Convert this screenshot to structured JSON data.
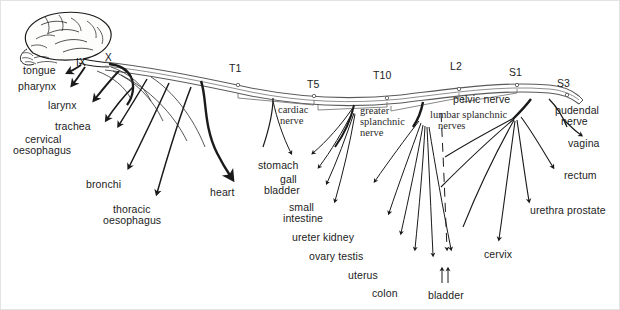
{
  "figure": {
    "background": "#ffffff",
    "ink": "#1a1a1a"
  },
  "cranial_nerves": [
    {
      "name": "glossopharyngeal",
      "label": "IX",
      "x": 78,
      "y": 62
    },
    {
      "name": "vagus",
      "label": "X",
      "x": 106,
      "y": 57
    }
  ],
  "spinal_segments": [
    {
      "label": "T1",
      "x": 237,
      "y": 68,
      "tick_x": 237,
      "tick_y": 84
    },
    {
      "label": "T5",
      "x": 313,
      "y": 84,
      "tick_x": 313,
      "tick_y": 96
    },
    {
      "label": "T10",
      "x": 382,
      "y": 75,
      "tick_x": 386,
      "tick_y": 92
    },
    {
      "label": "L2",
      "x": 455,
      "y": 66,
      "tick_x": 458,
      "tick_y": 83
    },
    {
      "label": "S1",
      "x": 512,
      "y": 72,
      "tick_x": 516,
      "tick_y": 85
    },
    {
      "label": "S3",
      "x": 561,
      "y": 82,
      "tick_x": 566,
      "tick_y": 95
    }
  ],
  "nerve_trunks": [
    {
      "name": "cardiac-nerve",
      "label": "cardiac\nnerve",
      "line1": "cardiac",
      "line2": "nerve",
      "x": 275,
      "y": 106,
      "style": "serif"
    },
    {
      "name": "greater-splanchnic-nerve",
      "label": "greater splanchnic nerve",
      "line1": "greater",
      "line2": "splanchnic",
      "line3": "nerve",
      "x": 360,
      "y": 108,
      "style": "serif"
    },
    {
      "name": "lumbar-splanchnic-nerves",
      "label": "lumbar splanchnic nerves",
      "line1": "lumbar splanchnic",
      "line2": "nerves",
      "x": 430,
      "y": 112,
      "style": "serif"
    },
    {
      "name": "pelvic-nerve",
      "label": "pelvic nerve",
      "x": 468,
      "y": 97,
      "style": "sans"
    },
    {
      "name": "pudendal-nerve",
      "label": "pudendal nerve",
      "line1": "pudendal",
      "line2": "nerve",
      "x": 556,
      "y": 108,
      "style": "sans"
    }
  ],
  "organ_labels": [
    {
      "name": "tongue",
      "text": "tongue",
      "x": 24,
      "y": 68,
      "align": "left"
    },
    {
      "name": "pharynx",
      "text": "pharynx",
      "x": 20,
      "y": 84,
      "align": "left"
    },
    {
      "name": "larynx",
      "text": "larynx",
      "x": 50,
      "y": 102,
      "align": "left"
    },
    {
      "name": "trachea",
      "text": "trachea",
      "x": 57,
      "y": 124,
      "align": "left"
    },
    {
      "name": "cervical-oesophagus",
      "text": "cervical oesophagus",
      "line1": "cervical",
      "line2": "oesophagus",
      "x": 22,
      "y": 136,
      "align": "left"
    },
    {
      "name": "bronchi",
      "text": "bronchi",
      "x": 86,
      "y": 182,
      "align": "left"
    },
    {
      "name": "thoracic-oesophagus",
      "text": "thoracic oesophagus",
      "line1": "thoracic",
      "line2": "oesophagus",
      "x": 110,
      "y": 207,
      "align": "left"
    },
    {
      "name": "heart",
      "text": "heart",
      "x": 210,
      "y": 190,
      "align": "left"
    },
    {
      "name": "stomach",
      "text": "stomach",
      "x": 258,
      "y": 163,
      "align": "left"
    },
    {
      "name": "gall-bladder",
      "text": "gall bladder",
      "line1": "gall",
      "line2": "bladder",
      "x": 265,
      "y": 177,
      "align": "left"
    },
    {
      "name": "small-intestine",
      "text": "small intestine",
      "line1": "small",
      "line2": "intestine",
      "x": 273,
      "y": 205,
      "align": "left"
    },
    {
      "name": "ureter-kidney",
      "text": "ureter kidney",
      "x": 285,
      "y": 234,
      "align": "left"
    },
    {
      "name": "ovary-testis",
      "text": "ovary testis",
      "x": 303,
      "y": 253,
      "align": "left"
    },
    {
      "name": "uterus",
      "text": "uterus",
      "x": 348,
      "y": 272,
      "align": "left"
    },
    {
      "name": "colon",
      "text": "colon",
      "x": 372,
      "y": 290,
      "align": "left"
    },
    {
      "name": "bladder",
      "text": "bladder",
      "x": 428,
      "y": 292,
      "align": "left"
    },
    {
      "name": "cervix",
      "text": "cervix",
      "x": 484,
      "y": 252,
      "align": "left"
    },
    {
      "name": "urethra-prostate",
      "text": "urethra prostate",
      "x": 530,
      "y": 208,
      "align": "left"
    },
    {
      "name": "rectum",
      "text": "rectum",
      "x": 564,
      "y": 173,
      "align": "left"
    },
    {
      "name": "vagina",
      "text": "vagina",
      "x": 568,
      "y": 141,
      "align": "left"
    }
  ]
}
